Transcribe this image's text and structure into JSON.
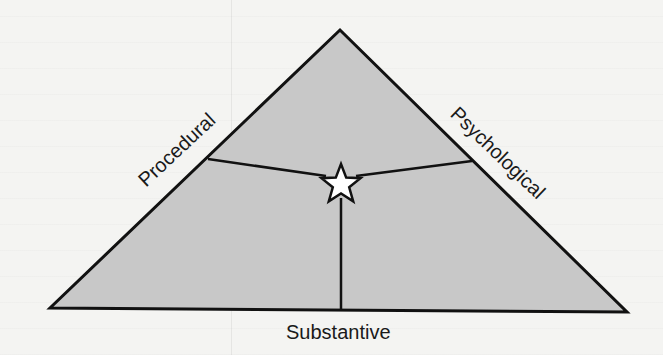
{
  "diagram": {
    "type": "triangle-with-central-star",
    "colors": {
      "background": "#f4f4f2",
      "triangle_fill": "#c8c8c8",
      "stroke": "#111111",
      "star_fill": "#ffffff"
    },
    "sides": {
      "left": "Procedural",
      "right": "Psychological",
      "bottom": "Substantive"
    },
    "center_marker": "star-icon"
  }
}
